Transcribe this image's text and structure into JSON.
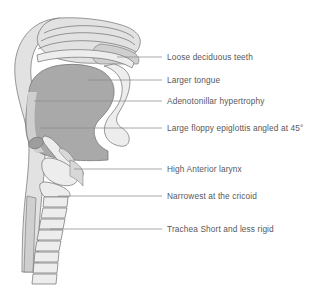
{
  "figure": {
    "background_color": "#ffffff",
    "label_text_color": "#58585a",
    "leader_line_color": "#8c8c8e",
    "outline_color": "#6e6e70",
    "fill_light": "#e2e2e2",
    "fill_mid": "#cfcfcf",
    "fill_tongue": "#a9a9a9",
    "fill_pale": "#ededed"
  },
  "callouts": [
    {
      "id": "loose-deciduous-teeth",
      "label": "Loose deciduous teeth",
      "text_x": 167,
      "text_y": 52,
      "leader_x1": 117,
      "leader_y1": 57,
      "leader_x2": 162,
      "leader_y2": 57
    },
    {
      "id": "larger-tongue",
      "label": "Larger tongue",
      "text_x": 167,
      "text_y": 75,
      "leader_x1": 88,
      "leader_y1": 80,
      "leader_x2": 162,
      "leader_y2": 80
    },
    {
      "id": "adenotonillar-hypertrophy",
      "label": "Adenotonillar hypertrophy",
      "text_x": 167,
      "text_y": 96,
      "leader_x1": 34,
      "leader_y1": 101,
      "leader_x2": 162,
      "leader_y2": 101
    },
    {
      "id": "large-floppy-epiglottis",
      "label": "Large floppy epiglottis angled at 45°",
      "text_x": 167,
      "text_y": 123,
      "leader_x1": 40,
      "leader_y1": 128,
      "leader_x2": 162,
      "leader_y2": 128
    },
    {
      "id": "high-anterior-larynx",
      "label": "High Anterior larynx",
      "text_x": 167,
      "text_y": 164,
      "leader_x1": 74,
      "leader_y1": 169,
      "leader_x2": 162,
      "leader_y2": 169
    },
    {
      "id": "narrowest-at-the-cricoid",
      "label": "Narrowest at the cricoid",
      "text_x": 167,
      "text_y": 191,
      "leader_x1": 58,
      "leader_y1": 196,
      "leader_x2": 162,
      "leader_y2": 196
    },
    {
      "id": "trachea-short-and-less-rigid",
      "label": "Trachea Short and less rigid",
      "text_x": 167,
      "text_y": 224,
      "leader_x1": 50,
      "leader_y1": 229,
      "leader_x2": 162,
      "leader_y2": 229
    }
  ],
  "anatomy_parts": [
    {
      "id": "head-profile",
      "name": "head-and-neck-profile"
    },
    {
      "id": "nasal-cavity",
      "name": "nasal-cavity-turbinates"
    },
    {
      "id": "hard-palate",
      "name": "hard-palate"
    },
    {
      "id": "soft-palate-uvula",
      "name": "soft-palate-uvula"
    },
    {
      "id": "tongue",
      "name": "enlarged-tongue"
    },
    {
      "id": "adenoid-tonsil-mass",
      "name": "adenotonsillar-tissue"
    },
    {
      "id": "epiglottis",
      "name": "floppy-epiglottis"
    },
    {
      "id": "larynx",
      "name": "high-anterior-larynx"
    },
    {
      "id": "cricoid",
      "name": "cricoid-ring"
    },
    {
      "id": "trachea-rings",
      "name": "tracheal-cartilage-rings",
      "ring_count": 8
    },
    {
      "id": "cervical-spine",
      "name": "cervical-spine-column"
    }
  ]
}
